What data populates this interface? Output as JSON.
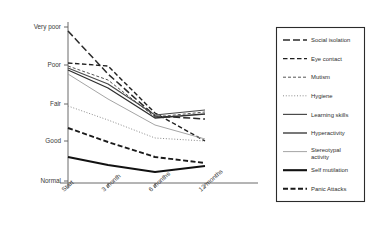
{
  "chart_data": {
    "type": "line",
    "title": "",
    "xlabel": "",
    "ylabel": "",
    "grid": false,
    "legend_position": "right",
    "categories": [
      "Start",
      "3 month",
      "6 months",
      "12 months"
    ],
    "y_tick_labels": [
      "Very poor",
      "Poor",
      "Fair",
      "Good",
      "Normal"
    ],
    "y_scale_note": "Ordinal scale, Very poor at top, Normal at bottom",
    "ylim": [
      "Normal",
      "Very poor"
    ],
    "series": [
      {
        "name": "Social isolation",
        "style": "long-dash",
        "color": "#2b2b2b",
        "width": 1.5,
        "values": [
          "Very poor",
          "Poor",
          "Fair",
          "Fair"
        ],
        "y_px": [
          31,
          74,
          116,
          119
        ]
      },
      {
        "name": "Eye contact",
        "style": "dashed",
        "color": "#1f1f1f",
        "width": 1.4,
        "values": [
          "Poor",
          "Poor",
          "Fair",
          "Good"
        ],
        "y_px": [
          63,
          66,
          113,
          141
        ]
      },
      {
        "name": "Mutism",
        "style": "short-dash",
        "color": "#555555",
        "width": 1.0,
        "values": [
          "Poor",
          "Poor",
          "Fair",
          "Fair"
        ],
        "y_px": [
          66,
          80,
          117,
          112
        ]
      },
      {
        "name": "Hygiene",
        "style": "fine-dot",
        "color": "#8c8c8c",
        "width": 1.0,
        "values": [
          "Fair",
          "Fair",
          "Good",
          "Good"
        ],
        "y_px": [
          106,
          120,
          138,
          141
        ]
      },
      {
        "name": "Learning skills",
        "style": "solid",
        "color": "#4a4a4a",
        "width": 1.2,
        "values": [
          "Poor",
          "Poor",
          "Fair",
          "Fair"
        ],
        "y_px": [
          68,
          84,
          115,
          110
        ]
      },
      {
        "name": "Hyperactivity",
        "style": "solid",
        "color": "#2f2f2f",
        "width": 1.3,
        "values": [
          "Poor",
          "Poor",
          "Fair",
          "Fair"
        ],
        "y_px": [
          70,
          88,
          118,
          114
        ]
      },
      {
        "name": "Stereotypal activity",
        "style": "thin-solid",
        "color": "#9a9a9a",
        "width": 0.9,
        "values": [
          "Poor",
          "Fair",
          "Fair",
          "Good"
        ],
        "y_px": [
          74,
          99,
          125,
          139
        ]
      },
      {
        "name": "Self mutilation",
        "style": "thick-solid",
        "color": "#111111",
        "width": 2.1,
        "values": [
          "Good",
          "Good",
          "Good",
          "Good"
        ],
        "y_px": [
          157,
          165,
          172,
          166
        ]
      },
      {
        "name": "Panic Attacks",
        "style": "heavy-dash",
        "color": "#1a1a1a",
        "width": 1.9,
        "values": [
          "Good",
          "Good",
          "Good",
          "Good"
        ],
        "y_px": [
          128,
          142,
          157,
          163
        ]
      }
    ]
  },
  "axes": {
    "y_ticks": [
      {
        "label": "Very poor",
        "y": 27
      },
      {
        "label": "Poor",
        "y": 65
      },
      {
        "label": "Fair",
        "y": 104
      },
      {
        "label": "Good",
        "y": 141
      },
      {
        "label": "Normal",
        "y": 181
      }
    ],
    "x_ticks": [
      {
        "label": "Start",
        "x": 68
      },
      {
        "label": "3 month",
        "x": 108
      },
      {
        "label": "6 months",
        "x": 155
      },
      {
        "label": "12 months",
        "x": 205
      }
    ]
  },
  "legend": {
    "items": [
      {
        "label": "Social isolation"
      },
      {
        "label": "Eye contact"
      },
      {
        "label": "Mutism"
      },
      {
        "label": "Hygiene"
      },
      {
        "label": "Learning skills"
      },
      {
        "label": "Hyperactivity"
      },
      {
        "label": "Stereotypal activity"
      },
      {
        "label": "Self mutilation"
      },
      {
        "label": "Panic Attacks"
      }
    ]
  }
}
